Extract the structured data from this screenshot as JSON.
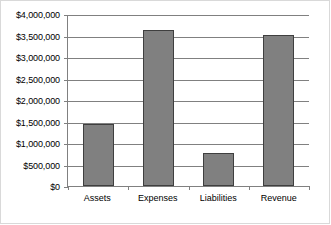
{
  "chart_data": {
    "type": "bar",
    "title": "",
    "xlabel": "",
    "ylabel": "",
    "categories": [
      "Assets",
      "Expenses",
      "Liabilities",
      "Revenue"
    ],
    "values": [
      1450000,
      3620000,
      770000,
      3520000
    ],
    "ylim": [
      0,
      4000000
    ],
    "ytick_step": 500000,
    "ytick_labels": [
      "$4,000,000",
      "$3,500,000",
      "$3,000,000",
      "$2,500,000",
      "$2,000,000",
      "$1,500,000",
      "$1,000,000",
      "$500,000",
      "$0"
    ],
    "ytick_values": [
      4000000,
      3500000,
      3000000,
      2500000,
      2000000,
      1500000,
      1000000,
      500000,
      0
    ],
    "grid": true,
    "legend": false,
    "legend_position": "none",
    "colors": {
      "bar_fill": "#808080",
      "bar_border": "#3f3f3f",
      "gridline": "#808080",
      "axis": "#808080",
      "frame": "#d9d9d9",
      "text": "#000000",
      "background": "#ffffff"
    }
  }
}
